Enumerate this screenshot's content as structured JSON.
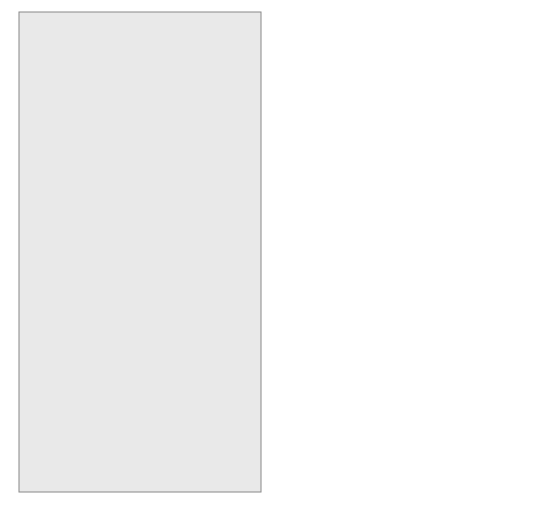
{
  "figure": {
    "panel_a": {
      "label": "(a)",
      "protein_label": "Cop protein",
      "mrna_label": "Cop mRNA",
      "regulation_sign": "−",
      "gene_labels": {
        "promoter": "P",
        "promoter_sub": "cop",
        "gene": "cop",
        "origin": "ori"
      }
    },
    "panel_b": {
      "label": "(b)",
      "cop_protein_label": "Cop protein",
      "cop_mrna_label": "Cop mRNA",
      "rep_protein_label": "Rep protein",
      "rep_mrna_label": "Rep mRNA",
      "cop_regulation_sign": "−",
      "rep_regulation_sign": "+",
      "gene_labels": {
        "cop_promoter": "P",
        "cop_promoter_sub": "cop",
        "cop_gene": "cop",
        "rep_promoter": "P/O",
        "rep_promoter_sub": "rep",
        "rep_gene": "rep",
        "origin": "ori"
      }
    },
    "colors": {
      "background": "#e9e9e9",
      "border": "#888888",
      "line": "#222222",
      "cop_protein": "#3a3a3a",
      "rep_protein": "#7a7a7a",
      "promoter": "#111111",
      "gene_box": "#ffffff"
    }
  }
}
